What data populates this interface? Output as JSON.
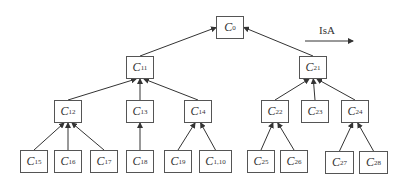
{
  "diagram": {
    "legend": {
      "label": "IsA",
      "arrow": "IsA relation direction (child → parent)"
    },
    "nodes": [
      {
        "id": "C0",
        "base": "C",
        "sub": "0",
        "x": 216,
        "y": 16,
        "w": 28,
        "h": 23
      },
      {
        "id": "C11",
        "base": "C",
        "sub": "11",
        "x": 126,
        "y": 56,
        "w": 28,
        "h": 23
      },
      {
        "id": "C21",
        "base": "C",
        "sub": "21",
        "x": 299,
        "y": 56,
        "w": 28,
        "h": 23
      },
      {
        "id": "C12",
        "base": "C",
        "sub": "12",
        "x": 54,
        "y": 100,
        "w": 28,
        "h": 23
      },
      {
        "id": "C13",
        "base": "C",
        "sub": "13",
        "x": 126,
        "y": 100,
        "w": 28,
        "h": 23
      },
      {
        "id": "C14",
        "base": "C",
        "sub": "14",
        "x": 184,
        "y": 100,
        "w": 28,
        "h": 23
      },
      {
        "id": "C22",
        "base": "C",
        "sub": "22",
        "x": 261,
        "y": 100,
        "w": 28,
        "h": 23
      },
      {
        "id": "C23",
        "base": "C",
        "sub": "23",
        "x": 301,
        "y": 100,
        "w": 28,
        "h": 23
      },
      {
        "id": "C24",
        "base": "C",
        "sub": "24",
        "x": 341,
        "y": 100,
        "w": 28,
        "h": 23
      },
      {
        "id": "C15",
        "base": "C",
        "sub": "15",
        "x": 20,
        "y": 150,
        "w": 28,
        "h": 23
      },
      {
        "id": "C16",
        "base": "C",
        "sub": "16",
        "x": 54,
        "y": 150,
        "w": 28,
        "h": 23
      },
      {
        "id": "C17",
        "base": "C",
        "sub": "17",
        "x": 90,
        "y": 150,
        "w": 28,
        "h": 23
      },
      {
        "id": "C18",
        "base": "C",
        "sub": "18",
        "x": 126,
        "y": 150,
        "w": 28,
        "h": 23
      },
      {
        "id": "C19",
        "base": "C",
        "sub": "19",
        "x": 164,
        "y": 150,
        "w": 28,
        "h": 23
      },
      {
        "id": "C110",
        "base": "C",
        "sub": "1,10",
        "x": 199,
        "y": 150,
        "w": 33,
        "h": 23
      },
      {
        "id": "C25",
        "base": "C",
        "sub": "25",
        "x": 247,
        "y": 150,
        "w": 28,
        "h": 23
      },
      {
        "id": "C26",
        "base": "C",
        "sub": "26",
        "x": 280,
        "y": 150,
        "w": 28,
        "h": 23
      },
      {
        "id": "C27",
        "base": "C",
        "sub": "27",
        "x": 325,
        "y": 151,
        "w": 29,
        "h": 23
      },
      {
        "id": "C28",
        "base": "C",
        "sub": "28",
        "x": 359,
        "y": 151,
        "w": 29,
        "h": 23
      }
    ],
    "edges": [
      [
        "C11",
        "C0"
      ],
      [
        "C21",
        "C0"
      ],
      [
        "C12",
        "C11"
      ],
      [
        "C13",
        "C11"
      ],
      [
        "C14",
        "C11"
      ],
      [
        "C22",
        "C21"
      ],
      [
        "C23",
        "C21"
      ],
      [
        "C24",
        "C21"
      ],
      [
        "C15",
        "C12"
      ],
      [
        "C16",
        "C12"
      ],
      [
        "C17",
        "C12"
      ],
      [
        "C18",
        "C13"
      ],
      [
        "C19",
        "C14"
      ],
      [
        "C110",
        "C14"
      ],
      [
        "C25",
        "C22"
      ],
      [
        "C26",
        "C22"
      ],
      [
        "C27",
        "C24"
      ],
      [
        "C28",
        "C24"
      ]
    ]
  }
}
